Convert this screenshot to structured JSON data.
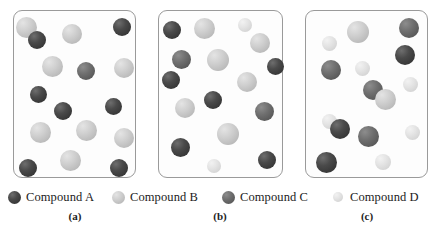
{
  "figure": {
    "type": "molecular-mixture-diagram",
    "panels": [
      {
        "id": "a",
        "label": "(a)",
        "box": {
          "x": 13,
          "y": 10,
          "w": 123,
          "h": 168
        },
        "spheres": [
          {
            "compound": "B",
            "cx": 26,
            "cy": 27,
            "r": 10.5
          },
          {
            "compound": "A",
            "cx": 37,
            "cy": 40,
            "r": 9.0
          },
          {
            "compound": "B",
            "cx": 72,
            "cy": 34,
            "r": 10.0
          },
          {
            "compound": "A",
            "cx": 122,
            "cy": 27,
            "r": 9.0
          },
          {
            "compound": "B",
            "cx": 52,
            "cy": 66,
            "r": 10.5
          },
          {
            "compound": "C",
            "cx": 86,
            "cy": 71,
            "r": 9.0
          },
          {
            "compound": "B",
            "cx": 124,
            "cy": 68,
            "r": 10.0
          },
          {
            "compound": "A",
            "cx": 38,
            "cy": 94,
            "r": 8.5
          },
          {
            "compound": "A",
            "cx": 113,
            "cy": 106,
            "r": 8.5
          },
          {
            "compound": "A",
            "cx": 63,
            "cy": 111,
            "r": 9.0
          },
          {
            "compound": "B",
            "cx": 40,
            "cy": 132,
            "r": 10.5
          },
          {
            "compound": "B",
            "cx": 86,
            "cy": 130,
            "r": 10.5
          },
          {
            "compound": "B",
            "cx": 124,
            "cy": 138,
            "r": 10.0
          },
          {
            "compound": "B",
            "cx": 70,
            "cy": 160,
            "r": 10.5
          },
          {
            "compound": "A",
            "cx": 28,
            "cy": 168,
            "r": 9.0
          },
          {
            "compound": "A",
            "cx": 119,
            "cy": 168,
            "r": 9.0
          }
        ]
      },
      {
        "id": "b",
        "label": "(b)",
        "box": {
          "x": 158,
          "y": 10,
          "w": 125,
          "h": 168
        },
        "spheres": [
          {
            "compound": "A",
            "cx": 172,
            "cy": 30,
            "r": 9.0
          },
          {
            "compound": "B",
            "cx": 204,
            "cy": 28,
            "r": 10.5
          },
          {
            "compound": "D",
            "cx": 245,
            "cy": 25,
            "r": 7.0
          },
          {
            "compound": "B",
            "cx": 260,
            "cy": 43,
            "r": 10.0
          },
          {
            "compound": "C",
            "cx": 181,
            "cy": 59,
            "r": 9.5
          },
          {
            "compound": "B",
            "cx": 218,
            "cy": 60,
            "r": 11.0
          },
          {
            "compound": "A",
            "cx": 275,
            "cy": 66,
            "r": 8.5
          },
          {
            "compound": "A",
            "cx": 171,
            "cy": 80,
            "r": 9.0
          },
          {
            "compound": "B",
            "cx": 247,
            "cy": 82,
            "r": 10.0
          },
          {
            "compound": "A",
            "cx": 213,
            "cy": 100,
            "r": 9.0
          },
          {
            "compound": "B",
            "cx": 185,
            "cy": 108,
            "r": 10.0
          },
          {
            "compound": "C",
            "cx": 264,
            "cy": 111,
            "r": 9.5
          },
          {
            "compound": "B",
            "cx": 228,
            "cy": 134,
            "r": 11.0
          },
          {
            "compound": "A",
            "cx": 180,
            "cy": 147,
            "r": 9.5
          },
          {
            "compound": "A",
            "cx": 267,
            "cy": 160,
            "r": 9.0
          },
          {
            "compound": "D",
            "cx": 214,
            "cy": 166,
            "r": 7.0
          }
        ]
      },
      {
        "id": "c",
        "label": "(c)",
        "box": {
          "x": 305,
          "y": 10,
          "w": 123,
          "h": 168
        },
        "spheres": [
          {
            "compound": "B",
            "cx": 358,
            "cy": 32,
            "r": 11.0
          },
          {
            "compound": "C",
            "cx": 409,
            "cy": 28,
            "r": 10.0
          },
          {
            "compound": "D",
            "cx": 329,
            "cy": 43,
            "r": 7.5
          },
          {
            "compound": "A",
            "cx": 405,
            "cy": 55,
            "r": 10.0
          },
          {
            "compound": "C",
            "cx": 331,
            "cy": 70,
            "r": 10.0
          },
          {
            "compound": "D",
            "cx": 362,
            "cy": 68,
            "r": 7.5
          },
          {
            "compound": "D",
            "cx": 410,
            "cy": 84,
            "r": 7.5
          },
          {
            "compound": "C",
            "cx": 373,
            "cy": 90,
            "r": 10.0
          },
          {
            "compound": "B",
            "cx": 385,
            "cy": 99,
            "r": 10.5
          },
          {
            "compound": "D",
            "cx": 329,
            "cy": 121,
            "r": 7.5
          },
          {
            "compound": "A",
            "cx": 340,
            "cy": 129,
            "r": 10.0
          },
          {
            "compound": "C",
            "cx": 368,
            "cy": 136,
            "r": 10.5
          },
          {
            "compound": "D",
            "cx": 412,
            "cy": 132,
            "r": 7.5
          },
          {
            "compound": "A",
            "cx": 326,
            "cy": 162,
            "r": 10.5
          },
          {
            "compound": "D",
            "cx": 383,
            "cy": 162,
            "r": 8.0
          }
        ]
      }
    ]
  },
  "legend": {
    "items": [
      {
        "key": "A",
        "label": "Compound A",
        "swatch": "sphere-dark",
        "x": 8,
        "color": "#3a3a3a"
      },
      {
        "key": "B",
        "label": "Compound B",
        "swatch": "sphere-light-gray",
        "x": 112,
        "color": "#c4c4c4"
      },
      {
        "key": "C",
        "label": "Compound C",
        "swatch": "sphere-mid-gray",
        "x": 222,
        "color": "#5f5f5f"
      },
      {
        "key": "D",
        "label": "Compound D",
        "swatch": "sphere-very-light",
        "x": 332,
        "color": "#dedede"
      }
    ]
  },
  "panel_labels": [
    {
      "text": "(a)",
      "x": 45,
      "y": 210
    },
    {
      "text": "(b)",
      "x": 190,
      "y": 210
    },
    {
      "text": "(c)",
      "x": 337,
      "y": 210
    }
  ]
}
